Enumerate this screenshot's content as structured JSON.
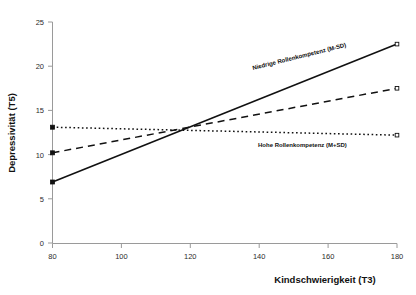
{
  "chart_data": {
    "type": "line",
    "title": "",
    "xlabel": "Kindschwierigkeit (T3)",
    "ylabel": "Depressivität (T5)",
    "xlim": [
      80,
      180
    ],
    "ylim": [
      0,
      25
    ],
    "xticks": [
      80,
      100,
      120,
      140,
      160,
      180
    ],
    "yticks": [
      0,
      5,
      10,
      15,
      20,
      25
    ],
    "grid": false,
    "legend": "inline-annotations",
    "x": [
      80,
      180
    ],
    "series": [
      {
        "name": "Niedrige Rollenkompetenz (M-SD)",
        "style": "solid",
        "values": [
          6.9,
          22.5
        ]
      },
      {
        "name": "Hohe Rollenkompetenz (M+SD)",
        "style": "dashed",
        "values": [
          10.2,
          17.5
        ]
      },
      {
        "name": "",
        "style": "dotted",
        "values": [
          13.1,
          12.2
        ]
      }
    ],
    "annotations": [
      {
        "text": "Niedrige Rollenkompetenz (M-SD)",
        "x": 134,
        "y": 19.5,
        "rotation": -14
      },
      {
        "text": "Hohe Rollenkompetenz (M+SD)",
        "x": 143,
        "y": 10.4,
        "rotation": 0
      }
    ]
  },
  "axes": {
    "x_tick_labels": [
      "80",
      "100",
      "120",
      "140",
      "160",
      "180"
    ],
    "y_tick_labels": [
      "0",
      "5",
      "10",
      "15",
      "20",
      "25"
    ],
    "x_axis_title": "Kindschwierigkeit (T3)",
    "y_axis_title": "Depressivität (T5)"
  },
  "labels": {
    "low_competence": "Niedrige Rollenkompetenz (M-SD)",
    "high_competence": "Hohe Rollenkompetenz (M+SD)"
  },
  "colors": {
    "line": "#111111",
    "axis": "#9a9a9a",
    "background": "#ffffff"
  }
}
